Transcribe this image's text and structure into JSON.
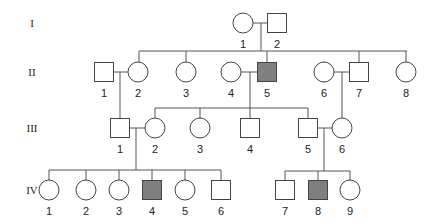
{
  "diagram": {
    "type": "pedigree",
    "colors": {
      "affected_fill": "#7f7f7f",
      "unaffected_fill": "#ffffff",
      "stroke": "#444444"
    },
    "generations": [
      {
        "label": "I",
        "y": 23
      },
      {
        "label": "II",
        "y": 72
      },
      {
        "label": "III",
        "y": 128
      },
      {
        "label": "IV",
        "y": 190
      }
    ],
    "individuals": [
      {
        "id": "I-1",
        "gen": 0,
        "num": "1",
        "sex": "female",
        "affected": false,
        "cx": 243
      },
      {
        "id": "I-2",
        "gen": 0,
        "num": "2",
        "sex": "male",
        "affected": false,
        "cx": 277
      },
      {
        "id": "II-1",
        "gen": 1,
        "num": "1",
        "sex": "male",
        "affected": false,
        "cx": 104
      },
      {
        "id": "II-2",
        "gen": 1,
        "num": "2",
        "sex": "female",
        "affected": false,
        "cx": 138
      },
      {
        "id": "II-3",
        "gen": 1,
        "num": "3",
        "sex": "female",
        "affected": false,
        "cx": 186
      },
      {
        "id": "II-4",
        "gen": 1,
        "num": "4",
        "sex": "female",
        "affected": false,
        "cx": 231
      },
      {
        "id": "II-5",
        "gen": 1,
        "num": "5",
        "sex": "male",
        "affected": true,
        "cx": 267
      },
      {
        "id": "II-6",
        "gen": 1,
        "num": "6",
        "sex": "female",
        "affected": false,
        "cx": 324
      },
      {
        "id": "II-7",
        "gen": 1,
        "num": "7",
        "sex": "male",
        "affected": false,
        "cx": 359
      },
      {
        "id": "II-8",
        "gen": 1,
        "num": "8",
        "sex": "female",
        "affected": false,
        "cx": 406
      },
      {
        "id": "III-1",
        "gen": 2,
        "num": "1",
        "sex": "male",
        "affected": false,
        "cx": 120
      },
      {
        "id": "III-2",
        "gen": 2,
        "num": "2",
        "sex": "female",
        "affected": false,
        "cx": 155
      },
      {
        "id": "III-3",
        "gen": 2,
        "num": "3",
        "sex": "female",
        "affected": false,
        "cx": 200
      },
      {
        "id": "III-4",
        "gen": 2,
        "num": "4",
        "sex": "male",
        "affected": false,
        "cx": 250
      },
      {
        "id": "III-5",
        "gen": 2,
        "num": "5",
        "sex": "male",
        "affected": false,
        "cx": 308
      },
      {
        "id": "III-6",
        "gen": 2,
        "num": "6",
        "sex": "female",
        "affected": false,
        "cx": 342
      },
      {
        "id": "IV-1",
        "gen": 3,
        "num": "1",
        "sex": "female",
        "affected": false,
        "cx": 49
      },
      {
        "id": "IV-2",
        "gen": 3,
        "num": "2",
        "sex": "female",
        "affected": false,
        "cx": 86
      },
      {
        "id": "IV-3",
        "gen": 3,
        "num": "3",
        "sex": "female",
        "affected": false,
        "cx": 119
      },
      {
        "id": "IV-4",
        "gen": 3,
        "num": "4",
        "sex": "male",
        "affected": true,
        "cx": 152
      },
      {
        "id": "IV-5",
        "gen": 3,
        "num": "5",
        "sex": "female",
        "affected": false,
        "cx": 185
      },
      {
        "id": "IV-6",
        "gen": 3,
        "num": "6",
        "sex": "male",
        "affected": false,
        "cx": 221
      },
      {
        "id": "IV-7",
        "gen": 3,
        "num": "7",
        "sex": "male",
        "affected": false,
        "cx": 285
      },
      {
        "id": "IV-8",
        "gen": 3,
        "num": "8",
        "sex": "male",
        "affected": true,
        "cx": 318
      },
      {
        "id": "IV-9",
        "gen": 3,
        "num": "9",
        "sex": "female",
        "affected": false,
        "cx": 350
      }
    ],
    "lines": [
      [
        253,
        23,
        268,
        23
      ],
      [
        261,
        23,
        261,
        51
      ],
      [
        139,
        51,
        407,
        51
      ],
      [
        139,
        51,
        139,
        62
      ],
      [
        186,
        51,
        186,
        62
      ],
      [
        267,
        51,
        267,
        62
      ],
      [
        359,
        51,
        359,
        62
      ],
      [
        406,
        51,
        406,
        62
      ],
      [
        112,
        72,
        128,
        72
      ],
      [
        120,
        72,
        120,
        118
      ],
      [
        241,
        72,
        258,
        72
      ],
      [
        250,
        72,
        250,
        108
      ],
      [
        334,
        72,
        350,
        72
      ],
      [
        342,
        72,
        342,
        118
      ],
      [
        155,
        108,
        308,
        108
      ],
      [
        155,
        108,
        155,
        118
      ],
      [
        200,
        108,
        200,
        118
      ],
      [
        250,
        108,
        250,
        120
      ],
      [
        308,
        108,
        308,
        120
      ],
      [
        128,
        128,
        145,
        128
      ],
      [
        136,
        128,
        136,
        170
      ],
      [
        316,
        128,
        332,
        128
      ],
      [
        324,
        128,
        324,
        171
      ],
      [
        49,
        170,
        221,
        170
      ],
      [
        49,
        170,
        49,
        180
      ],
      [
        86,
        170,
        86,
        180
      ],
      [
        119,
        170,
        119,
        180
      ],
      [
        152,
        170,
        152,
        182
      ],
      [
        185,
        170,
        185,
        180
      ],
      [
        221,
        170,
        221,
        182
      ],
      [
        285,
        171,
        350,
        171
      ],
      [
        285,
        171,
        285,
        182
      ],
      [
        318,
        171,
        318,
        182
      ],
      [
        350,
        171,
        350,
        180
      ]
    ]
  }
}
